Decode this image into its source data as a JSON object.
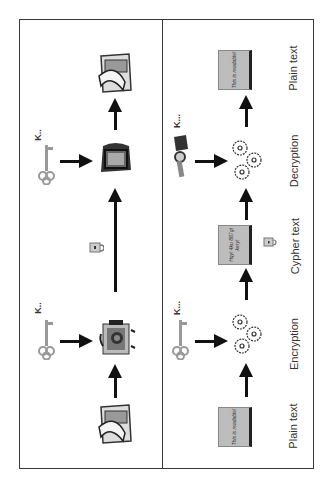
{
  "diagram": {
    "orientation": "rotated-90-ccw",
    "left_panel": {
      "description": "pictorial symmetric encryption",
      "icons": [
        "newspaper-icon",
        "key-icon",
        "locked-computer-icon",
        "padlock-icon",
        "computer-icon",
        "key-icon",
        "newspaper-icon"
      ],
      "key_labels": [
        "K..",
        "K.."
      ]
    },
    "right_panel": {
      "stages": [
        {
          "label": "Plain text",
          "book_text": "This is readable!"
        },
        {
          "label": "Encryption"
        },
        {
          "label": "Cypher text",
          "book_text": "Hqy! 4ku 887gt kery!"
        },
        {
          "label": "Decryption"
        },
        {
          "label": "Plain text",
          "book_text": "This is readable!"
        }
      ],
      "key_labels": [
        "K...",
        "K..."
      ]
    }
  }
}
